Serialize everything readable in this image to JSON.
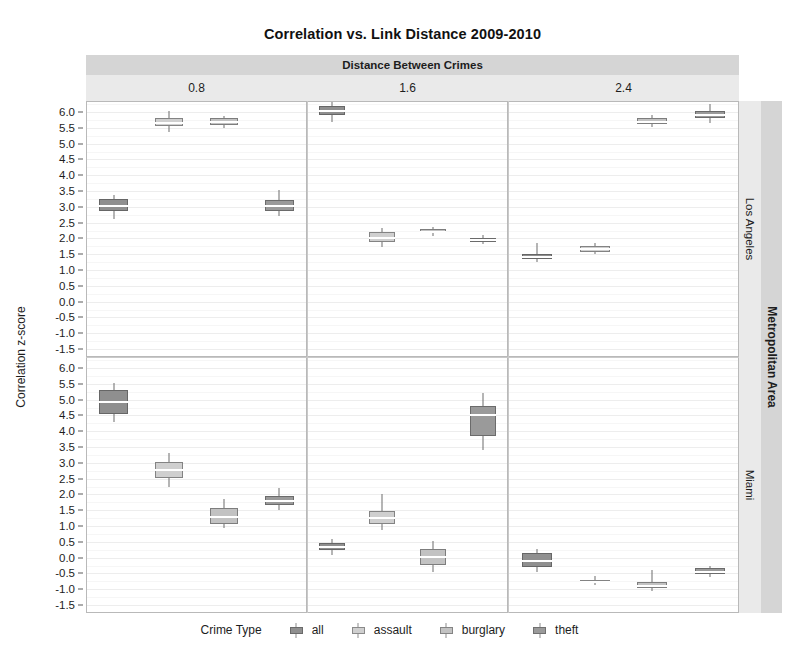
{
  "title": "Correlation vs. Link Distance 2009-2010",
  "facet_col_strip_label": "Distance Between Crimes",
  "facet_row_strip_label": "Metropolitan Area",
  "axis": {
    "ylabel": "Correlation z-score",
    "yticks": [
      "6.0",
      "5.5",
      "5.0",
      "4.5",
      "4.0",
      "3.5",
      "3.0",
      "2.5",
      "2.0",
      "1.5",
      "1.0",
      "0.5",
      "0.0",
      "-0.5",
      "-1.0",
      "-1.5"
    ],
    "ymin": -1.75,
    "ymax": 6.35
  },
  "legend": {
    "title": "Crime Type",
    "items": [
      {
        "label": "all",
        "color": "#8f8f8f"
      },
      {
        "label": "assault",
        "color": "#cfcfcf"
      },
      {
        "label": "burglary",
        "color": "#c2c2c2"
      },
      {
        "label": "theft",
        "color": "#9a9a9a"
      }
    ]
  },
  "colors": {
    "all": "#8f8f8f",
    "assault": "#cfcfcf",
    "burglary": "#c2c2c2",
    "theft": "#9a9a9a",
    "strip_outer": "#d5d5d5",
    "strip_inner": "#eaeaea",
    "panel_background": "#ffffff",
    "grid": "#ededed"
  },
  "chart_data": {
    "type": "box",
    "title": "Correlation vs. Link Distance 2009-2010",
    "xlabel": "",
    "ylabel": "Correlation z-score",
    "ylim": [
      -1.75,
      6.35
    ],
    "grid": true,
    "legend_position": "bottom",
    "facet_col_variable": "Distance Between Crimes",
    "facet_col_levels": [
      "0.8",
      "1.6",
      "2.4"
    ],
    "facet_row_variable": "Metropolitan Area",
    "facet_row_levels": [
      "Los Angeles",
      "Miami"
    ],
    "group_variable": "Crime Type",
    "groups": [
      "all",
      "assault",
      "burglary",
      "theft"
    ],
    "boxes": [
      {
        "row": "Los Angeles",
        "col": "0.8",
        "group": "all",
        "lower_whisker": 2.62,
        "q1": 2.86,
        "median": 3.02,
        "q3": 3.24,
        "upper_whisker": 3.38
      },
      {
        "row": "Los Angeles",
        "col": "0.8",
        "group": "assault",
        "lower_whisker": 5.38,
        "q1": 5.55,
        "median": 5.66,
        "q3": 5.82,
        "upper_whisker": 6.02
      },
      {
        "row": "Los Angeles",
        "col": "0.8",
        "group": "burglary",
        "lower_whisker": 5.5,
        "q1": 5.59,
        "median": 5.68,
        "q3": 5.8,
        "upper_whisker": 5.88
      },
      {
        "row": "Los Angeles",
        "col": "0.8",
        "group": "theft",
        "lower_whisker": 2.7,
        "q1": 2.88,
        "median": 3.02,
        "q3": 3.22,
        "upper_whisker": 3.52
      },
      {
        "row": "Los Angeles",
        "col": "1.6",
        "group": "all",
        "lower_whisker": 5.7,
        "q1": 5.92,
        "median": 6.04,
        "q3": 6.2,
        "upper_whisker": 6.32
      },
      {
        "row": "Los Angeles",
        "col": "1.6",
        "group": "assault",
        "lower_whisker": 1.72,
        "q1": 1.9,
        "median": 2.02,
        "q3": 2.2,
        "upper_whisker": 2.34
      },
      {
        "row": "Los Angeles",
        "col": "1.6",
        "group": "burglary",
        "lower_whisker": 2.08,
        "q1": 2.16,
        "median": 2.22,
        "q3": 2.3,
        "upper_whisker": 2.36
      },
      {
        "row": "Los Angeles",
        "col": "1.6",
        "group": "theft",
        "lower_whisker": 1.82,
        "q1": 1.9,
        "median": 1.96,
        "q3": 2.02,
        "upper_whisker": 2.1
      },
      {
        "row": "Los Angeles",
        "col": "2.4",
        "group": "all",
        "lower_whisker": 1.26,
        "q1": 1.34,
        "median": 1.42,
        "q3": 1.5,
        "upper_whisker": 1.86
      },
      {
        "row": "Los Angeles",
        "col": "2.4",
        "group": "assault",
        "lower_whisker": 1.52,
        "q1": 1.58,
        "median": 1.66,
        "q3": 1.76,
        "upper_whisker": 1.86
      },
      {
        "row": "Los Angeles",
        "col": "2.4",
        "group": "burglary",
        "lower_whisker": 5.52,
        "q1": 5.62,
        "median": 5.7,
        "q3": 5.8,
        "upper_whisker": 5.9
      },
      {
        "row": "Los Angeles",
        "col": "2.4",
        "group": "theft",
        "lower_whisker": 5.66,
        "q1": 5.82,
        "median": 5.92,
        "q3": 6.04,
        "upper_whisker": 6.24
      },
      {
        "row": "Miami",
        "col": "0.8",
        "group": "all",
        "lower_whisker": 4.28,
        "q1": 4.56,
        "median": 4.92,
        "q3": 5.32,
        "upper_whisker": 5.52
      },
      {
        "row": "Miami",
        "col": "0.8",
        "group": "assault",
        "lower_whisker": 2.24,
        "q1": 2.52,
        "median": 2.76,
        "q3": 3.04,
        "upper_whisker": 3.32
      },
      {
        "row": "Miami",
        "col": "0.8",
        "group": "burglary",
        "lower_whisker": 0.94,
        "q1": 1.06,
        "median": 1.3,
        "q3": 1.58,
        "upper_whisker": 1.86
      },
      {
        "row": "Miami",
        "col": "0.8",
        "group": "theft",
        "lower_whisker": 1.5,
        "q1": 1.68,
        "median": 1.8,
        "q3": 1.96,
        "upper_whisker": 2.22
      },
      {
        "row": "Miami",
        "col": "1.6",
        "group": "all",
        "lower_whisker": 0.1,
        "q1": 0.24,
        "median": 0.34,
        "q3": 0.48,
        "upper_whisker": 0.58
      },
      {
        "row": "Miami",
        "col": "1.6",
        "group": "assault",
        "lower_whisker": 0.86,
        "q1": 1.08,
        "median": 1.26,
        "q3": 1.48,
        "upper_whisker": 2.02
      },
      {
        "row": "Miami",
        "col": "1.6",
        "group": "burglary",
        "lower_whisker": -0.46,
        "q1": -0.22,
        "median": 0.02,
        "q3": 0.26,
        "upper_whisker": 0.54
      },
      {
        "row": "Miami",
        "col": "1.6",
        "group": "theft",
        "lower_whisker": 3.42,
        "q1": 3.84,
        "median": 4.52,
        "q3": 4.8,
        "upper_whisker": 5.22
      },
      {
        "row": "Miami",
        "col": "2.4",
        "group": "all",
        "lower_whisker": -0.46,
        "q1": -0.3,
        "median": -0.1,
        "q3": 0.14,
        "upper_whisker": 0.28
      },
      {
        "row": "Miami",
        "col": "2.4",
        "group": "assault",
        "lower_whisker": -0.86,
        "q1": -0.8,
        "median": -0.76,
        "q3": -0.7,
        "upper_whisker": -0.58
      },
      {
        "row": "Miami",
        "col": "2.4",
        "group": "burglary",
        "lower_whisker": -1.06,
        "q1": -0.96,
        "median": -0.88,
        "q3": -0.78,
        "upper_whisker": -0.4
      },
      {
        "row": "Miami",
        "col": "2.4",
        "group": "theft",
        "lower_whisker": -0.62,
        "q1": -0.52,
        "median": -0.44,
        "q3": -0.34,
        "upper_whisker": -0.26
      }
    ]
  }
}
